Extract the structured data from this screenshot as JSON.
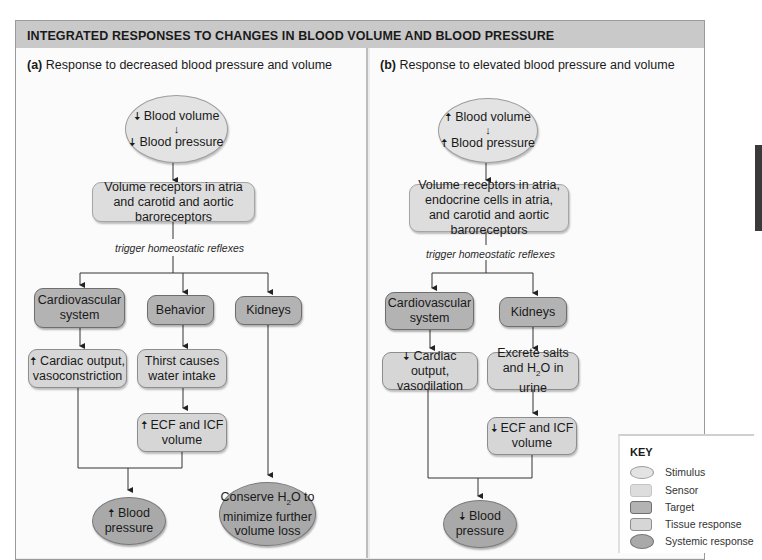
{
  "title": "INTEGRATED RESPONSES TO CHANGES IN BLOOD VOLUME AND BLOOD PRESSURE",
  "panel_a": {
    "label_prefix": "(a)",
    "label": " Response to decreased blood pressure and volume",
    "stimulus": {
      "line1": "Blood volume",
      "line2": "Blood pressure",
      "direction": "down"
    },
    "sensor": "Volume receptors in atria and carotid and aortic baroreceptors",
    "reflex": "trigger homeostatic reflexes",
    "targets": [
      "Cardiovascular system",
      "Behavior",
      "Kidneys"
    ],
    "tissue_responses": [
      "Cardiac output, vasoconstriction",
      "Thirst causes water intake",
      "ECF and ICF volume"
    ],
    "systemic_responses": [
      "Blood pressure",
      "Conserve H2O to minimize further volume loss"
    ]
  },
  "panel_b": {
    "label_prefix": "(b)",
    "label": " Response to elevated blood pressure and volume",
    "stimulus": {
      "line1": "Blood volume",
      "line2": "Blood pressure",
      "direction": "up"
    },
    "sensor": "Volume receptors in atria, endocrine cells in atria, and carotid and aortic baroreceptors",
    "reflex": "trigger homeostatic reflexes",
    "targets": [
      "Cardiovascular system",
      "Kidneys"
    ],
    "tissue_responses": [
      "Cardiac output, vasodilation",
      "Excrete salts and H2O in urine",
      "ECF and ICF volume"
    ],
    "systemic_responses": [
      "Blood pressure"
    ]
  },
  "key": {
    "title": "KEY",
    "items": [
      {
        "label": "Stimulus",
        "color": "#e3e3e3"
      },
      {
        "label": "Sensor",
        "color": "#dddddd"
      },
      {
        "label": "Target",
        "color": "#b3b3b3"
      },
      {
        "label": "Tissue response",
        "color": "#d6d6d6"
      },
      {
        "label": "Systemic response",
        "color": "#a9a9a9"
      }
    ]
  },
  "arrows": {
    "up": "🠅",
    "down": "🠇"
  }
}
